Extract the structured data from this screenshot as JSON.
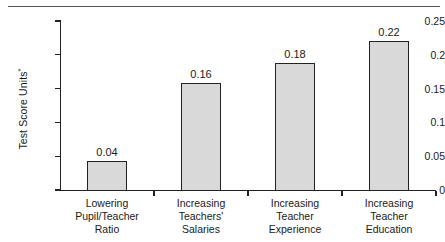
{
  "decoration": {
    "top_rule": "horizontal-rule"
  },
  "chart_data": {
    "type": "bar",
    "title": "",
    "subtitle": "",
    "xlabel": "",
    "ylabel": "Test Score Units*",
    "ylabel_text": "Test Score Units",
    "ylabel_superscript": "*",
    "categories": [
      "Lowering Pupil/Teacher Ratio",
      "Increasing Teachers' Salaries",
      "Increasing Teacher Experience",
      "Increasing Teacher Education"
    ],
    "category_lines": [
      [
        "Lowering",
        "Pupil/Teacher",
        "Ratio"
      ],
      [
        "Increasing",
        "Teachers'",
        "Salaries"
      ],
      [
        "Increasing",
        "Teacher",
        "Experience"
      ],
      [
        "Increasing",
        "Teacher",
        "Education"
      ]
    ],
    "values": [
      0.04,
      0.16,
      0.18,
      0.22
    ],
    "value_labels": [
      "0.04",
      "0.16",
      "0.18",
      "0.22"
    ],
    "plotted_values": [
      0.043,
      0.158,
      0.188,
      0.22
    ],
    "ylim": [
      0,
      0.25
    ],
    "yticks": [
      0,
      0.05,
      0.1,
      0.15,
      0.2,
      0.25
    ],
    "ytick_labels": [
      "0",
      "0.05",
      "0.1",
      "0.15",
      "0.2",
      "0.25"
    ],
    "grid": false,
    "legend": false,
    "legend_position": "none",
    "bar_fill_color": "#d9d9d9",
    "bar_border_color": "#232323",
    "axis_color": "#222222",
    "text_color": "#1a1a1a"
  }
}
